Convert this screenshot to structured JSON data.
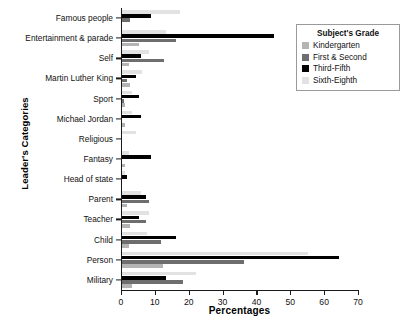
{
  "chart_data": {
    "type": "bar",
    "orientation": "horizontal",
    "title": "",
    "xlabel": "Percentages",
    "ylabel": "Leader's Categories",
    "xlim": [
      0,
      70
    ],
    "xticks": [
      0,
      10,
      20,
      30,
      40,
      50,
      60,
      70
    ],
    "grid": false,
    "legend_position": "top-right",
    "legend_title": "Subject's Grade",
    "categories": [
      "Famous people",
      "Entertainment & parade",
      "Self",
      "Martin Luther King",
      "Sport",
      "Michael Jordan",
      "Religious",
      "Fantasy",
      "Head of state",
      "Parent",
      "Teacher",
      "Child",
      "Person",
      "Military"
    ],
    "series": [
      {
        "name": "Kindergarten",
        "color": "#b4b4b4",
        "values": [
          0.0,
          5.0,
          2.0,
          2.5,
          1.0,
          1.0,
          0.0,
          1.0,
          0.0,
          1.5,
          2.5,
          2.0,
          12.0,
          3.0
        ]
      },
      {
        "name": "First & Second",
        "color": "#6e6e6e",
        "values": [
          2.5,
          16.0,
          12.5,
          1.5,
          0.5,
          0.0,
          0.0,
          0.0,
          0.0,
          8.0,
          7.0,
          11.5,
          36.0,
          18.0
        ]
      },
      {
        "name": "Third-Fifth",
        "color": "#000000",
        "values": [
          8.5,
          45.0,
          5.5,
          4.0,
          5.0,
          5.5,
          0.0,
          8.5,
          1.5,
          7.0,
          5.0,
          16.0,
          64.0,
          13.0
        ]
      },
      {
        "name": "Sixth-Eighth",
        "color": "#e2e2e2",
        "values": [
          17.0,
          13.0,
          8.0,
          6.0,
          3.0,
          3.0,
          4.0,
          2.0,
          1.0,
          5.5,
          8.0,
          7.5,
          55.0,
          22.0
        ]
      }
    ]
  }
}
